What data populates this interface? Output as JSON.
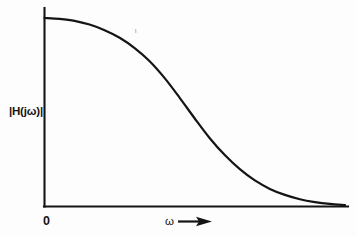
{
  "figure": {
    "background_color": "#fdfdfd",
    "ink_color": "#141414",
    "width": 356,
    "height": 237
  },
  "labels": {
    "y_axis": "|H(jω)|",
    "x_axis": "ω",
    "origin": "0",
    "x_axis_arrow": "right-arrow"
  },
  "chart_data": {
    "type": "line",
    "title": "",
    "subtitle": "",
    "xlabel": "ω",
    "ylabel": "|H(jω)|",
    "grid": false,
    "legend": false,
    "legend_position": "none",
    "axes": {
      "x_tick_labels": [
        "0"
      ],
      "y_tick_labels": [],
      "x_axis_arrowhead": true,
      "y_axis_arrowhead": false,
      "xlim": [
        0,
        1
      ],
      "ylim": [
        0,
        1
      ]
    },
    "series": [
      {
        "name": "|H(jω)|",
        "color": "#141414",
        "x": [
          0.0,
          0.05,
          0.1,
          0.15,
          0.2,
          0.25,
          0.3,
          0.35,
          0.4,
          0.45,
          0.5,
          0.55,
          0.6,
          0.65,
          0.7,
          0.75,
          0.8,
          0.85,
          0.9,
          0.95,
          1.0
        ],
        "y": [
          1.0,
          0.995,
          0.985,
          0.965,
          0.935,
          0.895,
          0.84,
          0.77,
          0.68,
          0.575,
          0.465,
          0.36,
          0.27,
          0.195,
          0.135,
          0.09,
          0.058,
          0.035,
          0.02,
          0.01,
          0.004
        ]
      }
    ],
    "annotations": []
  }
}
